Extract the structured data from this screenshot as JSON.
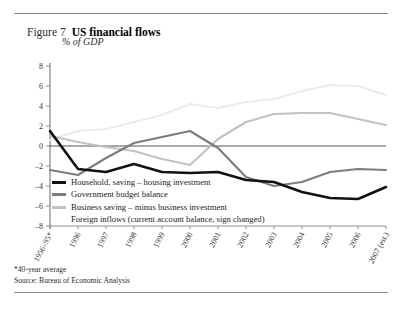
{
  "figure": {
    "number": "Figure 7",
    "title": "US financial flows",
    "subtitle": "% of GDP"
  },
  "notes": {
    "footnote": "*40-year average",
    "source": "Source: Bureau of Economic Analysis"
  },
  "legend": {
    "items": [
      {
        "label": "Household, saving – housing investment",
        "color": "#111111",
        "swatch": "solid"
      },
      {
        "label": "Government budget balance",
        "color": "#7d7d7d",
        "swatch": "solid"
      },
      {
        "label": "Business saving – minus business investment",
        "color": "#c2c2c2",
        "swatch": "solid"
      },
      {
        "label": "Foreign inflows (current account balance, sign changed)",
        "color": "#ececec",
        "swatch": "blank"
      }
    ]
  },
  "chart_data": {
    "type": "line",
    "title": "US financial flows",
    "subtitle": "% of GDP",
    "xlabel": "",
    "ylabel": "% of GDP",
    "ylim": [
      -8,
      8
    ],
    "yticks": [
      8,
      6,
      4,
      2,
      0,
      -2,
      -4,
      -6,
      -8
    ],
    "ytick_labels": [
      "8",
      "6",
      "4",
      "2",
      "0",
      "–2",
      "–4",
      "–6",
      "–8"
    ],
    "grid": false,
    "zero_line": true,
    "legend_position": "inside-lower-left",
    "categories": [
      "1956–95*",
      "1996",
      "1997",
      "1998",
      "1999",
      "2000",
      "2001",
      "2002",
      "2003",
      "2004",
      "2005",
      "2006",
      "2007 (est.)"
    ],
    "series": [
      {
        "name": "Household, saving – housing investment",
        "color": "#111111",
        "values": [
          1.5,
          -2.3,
          -2.6,
          -1.8,
          -2.6,
          -2.7,
          -2.6,
          -3.4,
          -3.6,
          -4.6,
          -5.2,
          -5.3,
          -4.1
        ]
      },
      {
        "name": "Government budget balance",
        "color": "#7d7d7d",
        "values": [
          -2.4,
          -2.9,
          -1.2,
          0.3,
          0.9,
          1.5,
          -0.2,
          -3.1,
          -4.0,
          -3.6,
          -2.6,
          -2.3,
          -2.4
        ]
      },
      {
        "name": "Business saving – minus business investment",
        "color": "#c2c2c2",
        "values": [
          1.0,
          0.4,
          -0.1,
          -0.5,
          -1.3,
          -1.9,
          0.7,
          2.4,
          3.2,
          3.3,
          3.3,
          2.7,
          2.1
        ]
      },
      {
        "name": "Foreign inflows (current account balance, sign changed)",
        "color": "#ececec",
        "values": [
          0.6,
          1.5,
          1.7,
          2.4,
          3.1,
          4.2,
          3.8,
          4.4,
          4.7,
          5.5,
          6.1,
          6.0,
          5.1
        ]
      }
    ]
  },
  "axis": {
    "x_tick_labels": [
      "1956–95*",
      "1996",
      "1997",
      "1998",
      "1999",
      "2000",
      "2001",
      "2002",
      "2003",
      "2004",
      "2005",
      "2006",
      "2007 (est.)"
    ]
  }
}
